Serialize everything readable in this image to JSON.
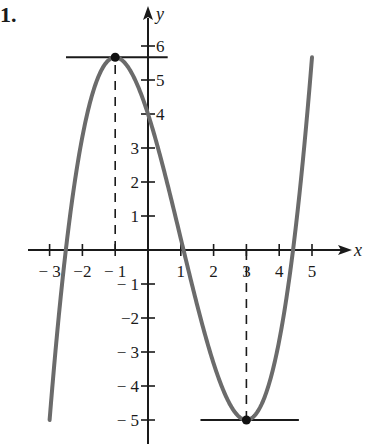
{
  "problem_number": "1.",
  "chart_data": {
    "type": "line",
    "title": "",
    "xlabel": "x",
    "ylabel": "y",
    "xlim": [
      -3.5,
      5.8
    ],
    "ylim": [
      -5.6,
      6.6
    ],
    "grid": false,
    "x_ticks": [
      -3,
      -2,
      -1,
      1,
      2,
      3,
      4,
      5
    ],
    "x_tick_labels": [
      "− 3",
      "−2",
      "− 1",
      "1",
      "2",
      "3",
      "4",
      "5"
    ],
    "y_ticks": [
      6,
      5,
      4,
      3,
      2,
      1,
      -1,
      -2,
      -3,
      -4,
      -5
    ],
    "y_tick_labels": [
      "6",
      "5",
      "4",
      "3",
      "2",
      "1",
      "− 1",
      "−2",
      "− 3",
      "− 4",
      "− 5"
    ],
    "series": [
      {
        "name": "f(x) = x^3/3 - x^2 - 3x + 4",
        "x": [
          -3,
          -2.5,
          -2,
          -1.5,
          -1,
          -0.5,
          0,
          0.5,
          1,
          1.5,
          2,
          2.5,
          3,
          3.5,
          4,
          4.5,
          5
        ],
        "values": [
          -5,
          0.04,
          3.33,
          5.38,
          5.67,
          4.71,
          4,
          2.29,
          0.33,
          -1.63,
          -3.33,
          -4.54,
          -5,
          -4.46,
          -2.67,
          0.63,
          5.67
        ]
      }
    ],
    "annotations": [
      {
        "type": "point",
        "label": "local maximum",
        "x": -1,
        "y": 5.67
      },
      {
        "type": "point",
        "label": "local minimum",
        "x": 3,
        "y": -5
      },
      {
        "type": "hline-segment",
        "label": "horizontal tangent at max",
        "y": 5.67,
        "x_from": -2.5,
        "x_to": 0.6
      },
      {
        "type": "hline-segment",
        "label": "horizontal tangent at min",
        "y": -5,
        "x_from": 1.6,
        "x_to": 4.6
      },
      {
        "type": "vline-dashed",
        "x": -1,
        "y_from": 0,
        "y_to": 5.67
      },
      {
        "type": "vline-dashed",
        "x": 3,
        "y_from": -5,
        "y_to": 0
      }
    ],
    "colors": {
      "curve": "#6b6b6b",
      "axes": "#1a1a1a",
      "points": "#111111"
    }
  }
}
